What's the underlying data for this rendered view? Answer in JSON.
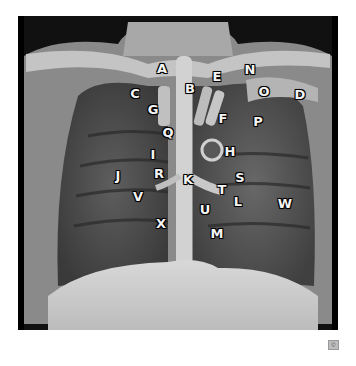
{
  "figure": {
    "labels": [
      {
        "letter": "A",
        "x": 162,
        "y": 68
      },
      {
        "letter": "B",
        "x": 190,
        "y": 88
      },
      {
        "letter": "C",
        "x": 135,
        "y": 93
      },
      {
        "letter": "D",
        "x": 300,
        "y": 94
      },
      {
        "letter": "E",
        "x": 217,
        "y": 76
      },
      {
        "letter": "F",
        "x": 223,
        "y": 118
      },
      {
        "letter": "G",
        "x": 153,
        "y": 109
      },
      {
        "letter": "H",
        "x": 230,
        "y": 151
      },
      {
        "letter": "I",
        "x": 153,
        "y": 154
      },
      {
        "letter": "J",
        "x": 118,
        "y": 175
      },
      {
        "letter": "K",
        "x": 188,
        "y": 179
      },
      {
        "letter": "L",
        "x": 238,
        "y": 201
      },
      {
        "letter": "M",
        "x": 217,
        "y": 233
      },
      {
        "letter": "N",
        "x": 250,
        "y": 69
      },
      {
        "letter": "O",
        "x": 264,
        "y": 91
      },
      {
        "letter": "P",
        "x": 258,
        "y": 121
      },
      {
        "letter": "Q",
        "x": 168,
        "y": 132
      },
      {
        "letter": "R",
        "x": 159,
        "y": 173
      },
      {
        "letter": "S",
        "x": 240,
        "y": 177
      },
      {
        "letter": "T",
        "x": 222,
        "y": 189
      },
      {
        "letter": "U",
        "x": 205,
        "y": 209
      },
      {
        "letter": "V",
        "x": 138,
        "y": 196
      },
      {
        "letter": "W",
        "x": 285,
        "y": 203
      },
      {
        "letter": "X",
        "x": 161,
        "y": 223
      }
    ],
    "corner_icon": "copyright-icon"
  }
}
